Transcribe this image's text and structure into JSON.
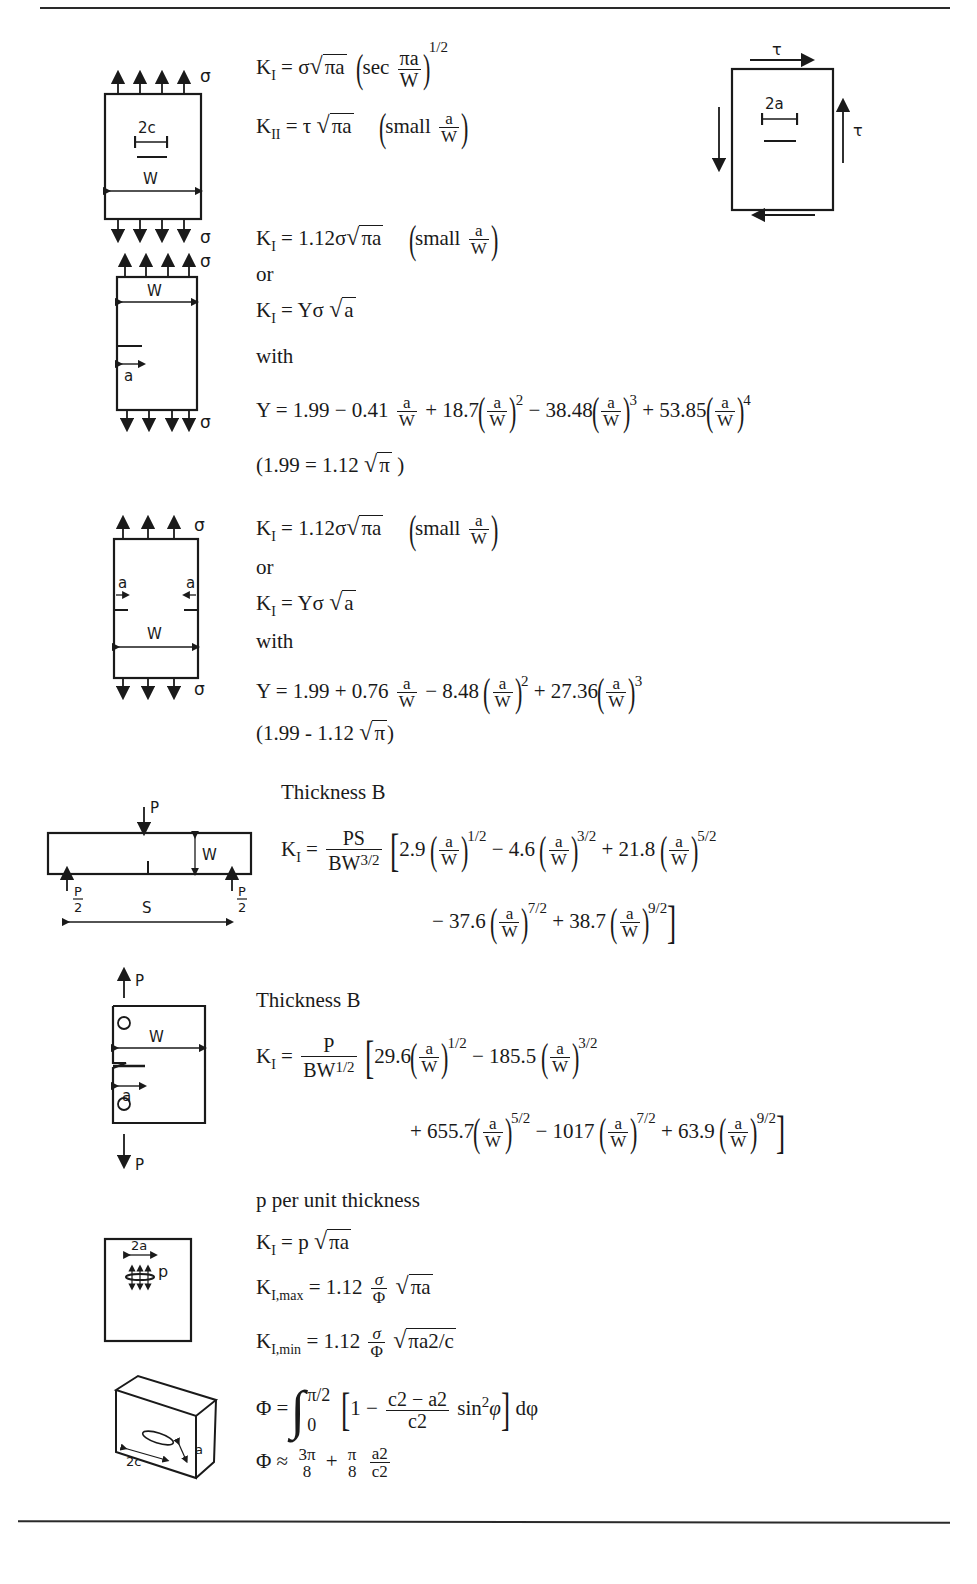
{
  "page": {
    "top_rule": true,
    "bottom_rule": true
  },
  "section1": {
    "diagram": {
      "sigma_top": "σ",
      "sigma_bottom": "σ",
      "crack_label": "2c",
      "width_label": "W",
      "icon": "center-cracked-plate-tension-diagram"
    },
    "shear_diagram": {
      "tau_top": "τ",
      "tau_right": "τ",
      "crack_label": "2a",
      "icon": "center-cracked-plate-shear-diagram"
    },
    "eq1": {
      "lhs": "K",
      "lhs_sub": "I",
      "rhs_a": "= σ",
      "sqrt_arg": "πa",
      "sec": "sec",
      "frac_num": "πa",
      "frac_den": "W",
      "exp": "1/2"
    },
    "eq2": {
      "lhs": "K",
      "lhs_sub": "II",
      "rhs_a": "= τ",
      "sqrt_arg": "πa",
      "note": "small",
      "frac_num": "a",
      "frac_den": "W"
    }
  },
  "section2": {
    "diagram": {
      "sigma_top": "σ",
      "sigma_bottom": "σ",
      "width_label": "W",
      "crack_label": "a",
      "icon": "edge-cracked-plate-diagram"
    },
    "eq1": {
      "lhs": "K",
      "lhs_sub": "I",
      "rhs": "= 1.12σ",
      "sqrt_arg": "πa",
      "note": "small",
      "frac_num": "a",
      "frac_den": "W"
    },
    "or": "or",
    "eq2": {
      "lhs": "K",
      "lhs_sub": "I",
      "rhs": "= Yσ",
      "sqrt_arg": "a"
    },
    "with": "with",
    "y_eq": {
      "lead": "Y = 1.99 − 0.41",
      "t2": "+ 18.7",
      "e2": "2",
      "t3": "− 38.48",
      "e3": "3",
      "t4": "+ 53.85",
      "e4": "4",
      "frac_num": "a",
      "frac_den": "W"
    },
    "note": {
      "open": "(1.99 = 1.12",
      "sqrt_arg": "π",
      "close": ")"
    }
  },
  "section3": {
    "diagram": {
      "sigma_top": "σ",
      "sigma_bottom": "σ",
      "width_label": "W",
      "crack_left": "a",
      "crack_right": "a",
      "icon": "double-edge-cracked-plate-diagram"
    },
    "eq1": {
      "lhs": "K",
      "lhs_sub": "I",
      "rhs": "= 1.12σ",
      "sqrt_arg": "πa",
      "note": "small",
      "frac_num": "a",
      "frac_den": "W"
    },
    "or": "or",
    "eq2": {
      "lhs": "K",
      "lhs_sub": "I",
      "rhs": "= Yσ",
      "sqrt_arg": "a"
    },
    "with": "with",
    "y_eq": {
      "lead": "Y = 1.99 + 0.76",
      "t2": "− 8.48",
      "e2": "2",
      "t3": "+ 27.36",
      "e3": "3",
      "frac_num": "a",
      "frac_den": "W"
    },
    "note": {
      "open": "(1.99 - 1.12",
      "sqrt_arg": "π",
      "close": ")"
    }
  },
  "section4": {
    "diagram": {
      "load_top": "P",
      "load_left_num": "P",
      "load_left_den": "2",
      "load_right_num": "P",
      "load_right_den": "2",
      "span_label": "S",
      "width_label": "W",
      "icon": "three-point-bend-specimen-diagram"
    },
    "thickness": "Thickness B",
    "eq": {
      "lhs": "K",
      "lhs_sub": "I",
      "pre_num": "PS",
      "pre_den_base": "BW",
      "pre_den_exp": "3/2",
      "terms_row1": [
        {
          "coef": "2.9",
          "exp": "1/2"
        },
        {
          "coef": "− 4.6",
          "exp": "3/2"
        },
        {
          "coef": "+ 21.8",
          "exp": "5/2"
        }
      ],
      "terms_row2": [
        {
          "coef": "− 37.6",
          "exp": "7/2"
        },
        {
          "coef": "+ 38.7",
          "exp": "9/2"
        }
      ],
      "frac_num": "a",
      "frac_den": "W"
    }
  },
  "section5": {
    "diagram": {
      "load_top": "P",
      "load_bottom": "P",
      "width_label": "W",
      "crack_label": "a",
      "icon": "compact-tension-specimen-diagram"
    },
    "thickness": "Thickness B",
    "eq": {
      "lhs": "K",
      "lhs_sub": "I",
      "pre_num": "P",
      "pre_den_base": "BW",
      "pre_den_exp": "1/2",
      "terms_row1": [
        {
          "coef": "29.6",
          "exp": "1/2"
        },
        {
          "coef": "− 185.5",
          "exp": "3/2"
        }
      ],
      "terms_row2": [
        {
          "coef": "+ 655.7",
          "exp": "5/2"
        },
        {
          "coef": "− 1017",
          "exp": "7/2"
        },
        {
          "coef": "+ 63.9",
          "exp": "9/2"
        }
      ],
      "frac_num": "a",
      "frac_den": "W"
    }
  },
  "section6": {
    "diagram": {
      "crack_label": "2a",
      "pressure_label": "p",
      "icon": "pressurized-crack-diagram"
    },
    "heading": "p per unit thickness",
    "eq1": {
      "lhs": "K",
      "lhs_sub": "I",
      "rhs": "= p",
      "sqrt_arg": "πa"
    }
  },
  "section7": {
    "diagram": {
      "length_label": "2c",
      "depth_label": "a",
      "icon": "semi-elliptical-surface-crack-diagram"
    },
    "eq_max": {
      "lhs": "K",
      "lhs_sub": "I,max",
      "rhs": "= 1.12",
      "frac_num": "σ",
      "frac_den": "Φ",
      "sqrt_arg": "πa"
    },
    "eq_min": {
      "lhs": "K",
      "lhs_sub": "I,min",
      "rhs": "= 1.12",
      "frac_num": "σ",
      "frac_den": "Φ",
      "sqrt_arg": "πa2/c"
    },
    "phi_integral": {
      "lhs": "Φ =",
      "upper": "π/2",
      "lower": "0",
      "one": "1 −",
      "num": "c2 − a2",
      "den": "c2",
      "sin": "sin",
      "sin_exp": "2",
      "var": "φ",
      "dphi": "dφ"
    },
    "phi_approx": {
      "lhs": "Φ ≈",
      "f1_num": "3π",
      "f1_den": "8",
      "plus": "+",
      "f2_num": "π",
      "f2_den": "8",
      "f3_num": "a2",
      "f3_den": "c2"
    }
  }
}
